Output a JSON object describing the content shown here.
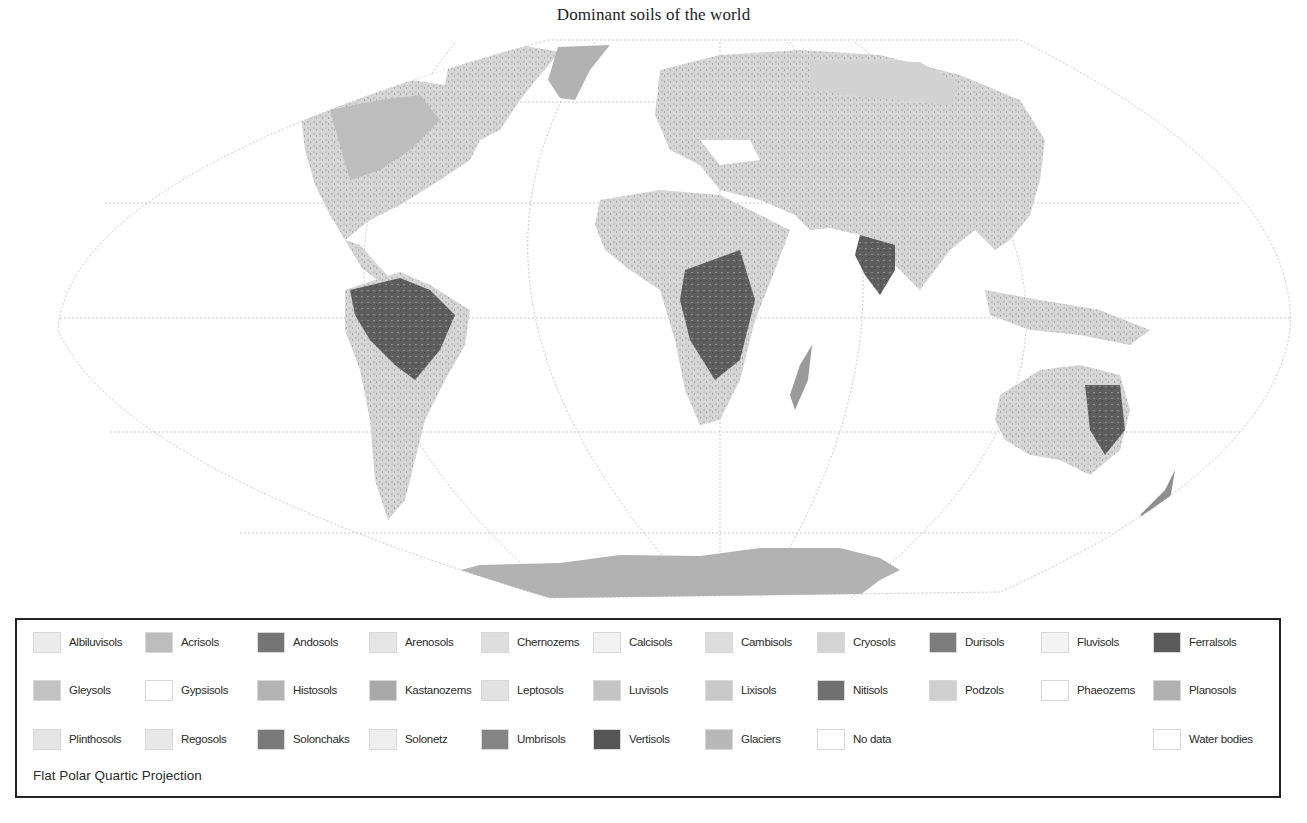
{
  "title": "Dominant soils of the world",
  "projection": "Flat Polar Quartic Projection",
  "legend": {
    "rows": [
      [
        {
          "label": "Albiluvisols",
          "color": "#ececec",
          "x": 0
        },
        {
          "label": "Acrisols",
          "color": "#bdbdbd",
          "x": 112
        },
        {
          "label": "Andosols",
          "color": "#757575",
          "x": 224
        },
        {
          "label": "Arenosols",
          "color": "#e6e6e6",
          "x": 336
        },
        {
          "label": "Chernozems",
          "color": "#dedede",
          "x": 448
        },
        {
          "label": "Calcisols",
          "color": "#f1f1f1",
          "x": 560
        },
        {
          "label": "Cambisols",
          "color": "#dcdcdc",
          "x": 672
        },
        {
          "label": "Cryosols",
          "color": "#d4d4d4",
          "x": 784
        },
        {
          "label": "Durisols",
          "color": "#7d7d7d",
          "x": 896
        },
        {
          "label": "Fluvisols",
          "color": "#f4f4f4",
          "x": 1008
        },
        {
          "label": "Ferralsols",
          "color": "#5a5a5a",
          "x": 1120
        }
      ],
      [
        {
          "label": "Gleysols",
          "color": "#c2c2c2",
          "x": 0
        },
        {
          "label": "Gypsisols",
          "color": "#ffffff",
          "x": 112
        },
        {
          "label": "Histosols",
          "color": "#b4b4b4",
          "x": 224
        },
        {
          "label": "Kastanozems",
          "color": "#a9a9a9",
          "x": 336
        },
        {
          "label": "Leptosols",
          "color": "#e2e2e2",
          "x": 448
        },
        {
          "label": "Luvisols",
          "color": "#c4c4c4",
          "x": 560
        },
        {
          "label": "Lixisols",
          "color": "#c9c9c9",
          "x": 672
        },
        {
          "label": "Nitisols",
          "color": "#707070",
          "x": 784
        },
        {
          "label": "Podzols",
          "color": "#cfcfcf",
          "x": 896
        },
        {
          "label": "Phaeozems",
          "color": "#ffffff",
          "x": 1008
        },
        {
          "label": "Planosols",
          "color": "#b0b0b0",
          "x": 1120
        }
      ],
      [
        {
          "label": "Plinthosols",
          "color": "#e4e4e4",
          "x": 0
        },
        {
          "label": "Regosols",
          "color": "#e8e8e8",
          "x": 112
        },
        {
          "label": "Solonchaks",
          "color": "#7a7a7a",
          "x": 224
        },
        {
          "label": "Solonetz",
          "color": "#eeeeee",
          "x": 336
        },
        {
          "label": "Umbrisols",
          "color": "#858585",
          "x": 448
        },
        {
          "label": "Vertisols",
          "color": "#555555",
          "x": 560
        },
        {
          "label": "Glaciers",
          "color": "#b8b8b8",
          "x": 672
        },
        {
          "label": "No data",
          "color": "#ffffff",
          "x": 784
        },
        {
          "label": "Water bodies",
          "color": "#ffffff",
          "x": 1120
        }
      ]
    ]
  },
  "colors": {
    "graticule": "#c8c8c8",
    "land_light": "#dcdcdc",
    "land_mid": "#bdbdbd",
    "land_dark": "#5f5f5f",
    "glacier": "#b2b2b2",
    "border": "#222222"
  }
}
